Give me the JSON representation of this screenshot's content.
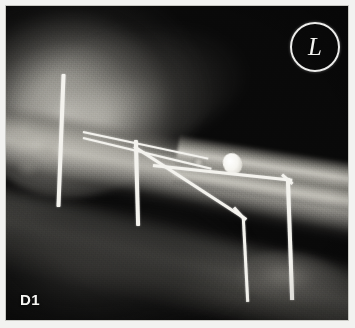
{
  "image": {
    "kind": "radiograph",
    "panel_label": "D1",
    "laterality_marker": "L",
    "background_color": "#090909",
    "implant_color": "#f4f3ee",
    "border_color": "#f2f2f0",
    "description_alt": "Lateral radiograph of a limb with orthopaedic fixation pins and wires"
  },
  "annotations": {
    "panel": {
      "name": "panel-label",
      "text": "D1"
    },
    "laterality": {
      "name": "laterality-marker",
      "text": "L"
    }
  },
  "anatomy": [
    {
      "name": "tissue-mass",
      "label": "proximal soft tissue mass"
    },
    {
      "name": "tissue-halo",
      "label": "soft tissue halo"
    },
    {
      "name": "limb-shaft",
      "label": "long bone shaft"
    },
    {
      "name": "distal-bone",
      "label": "distal bone segment"
    },
    {
      "name": "soft-band",
      "label": "soft tissue band"
    },
    {
      "name": "paw-blob",
      "label": "distal extremity soft tissue"
    },
    {
      "name": "joint-mottle",
      "label": "joint trabecular mottling"
    }
  ],
  "implants": [
    {
      "name": "pin-vertical-left",
      "label": "vertical fixation pin, proximal left"
    },
    {
      "name": "pin-vertical-mid",
      "label": "vertical fixation pin, mid"
    },
    {
      "name": "wire-strand-upper",
      "label": "cerclage wire, upper strand"
    },
    {
      "name": "wire-strand-lower",
      "label": "cerclage wire, lower strand"
    },
    {
      "name": "pin-bent-a-diagonal",
      "label": "bent pin A, diagonal segment"
    },
    {
      "name": "pin-bent-a-elbow",
      "label": "bent pin A, elbow"
    },
    {
      "name": "pin-bent-a-vertical",
      "label": "bent pin A, vertical segment"
    },
    {
      "name": "pin-bent-b-horizontal",
      "label": "bent pin B, horizontal segment"
    },
    {
      "name": "pin-bent-b-elbow",
      "label": "bent pin B, elbow"
    },
    {
      "name": "pin-bent-b-vertical",
      "label": "bent pin B, vertical segment"
    },
    {
      "name": "radiopaque-fragment",
      "label": "radiopaque fragment"
    },
    {
      "name": "fragment-satellite",
      "label": "small satellite opacity"
    }
  ]
}
